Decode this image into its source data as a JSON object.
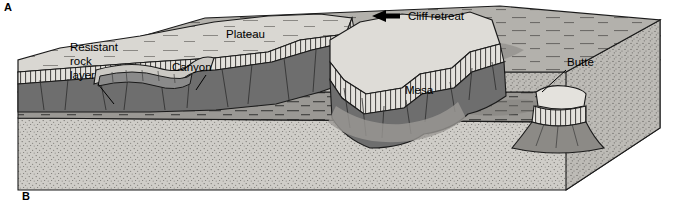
{
  "figure": {
    "background_color": "#ffffff"
  },
  "corner_labels": [
    {
      "name": "panel-label-a",
      "text": "A"
    },
    {
      "name": "panel-label-b",
      "text": "B"
    }
  ],
  "labels": {
    "resistant_rock_layer": "Resistant\nrock\nlayer",
    "resistant_line1": "Resistant",
    "resistant_line2": "rock",
    "resistant_line3": "layer",
    "canyon": "Canyon",
    "plateau": "Plateau",
    "cliff_retreat": "Cliff retreat",
    "mesa": "Mesa",
    "butte": "Butte"
  },
  "icons": {
    "cliff_retreat_arrow": "left-arrow-icon"
  },
  "colors": {
    "caprock_light": "#e8e6e1",
    "plateau_top": "#d9d7d2",
    "cliff_dark": "#6e6e6e",
    "cliff_mid": "#8a8a8a",
    "lowland_plain": "#b3b1ac",
    "shadow": "#8f8d89",
    "basal_stipple": "#cfcdc8",
    "bedded_layer": "#9a9894",
    "outline": "#1a1a1a",
    "side_face": "#bdbbb6"
  },
  "features": [
    {
      "name": "resistant-rock-layer",
      "type": "stratum",
      "description": "Light hatched caprock band forming cliff rims"
    },
    {
      "name": "canyon",
      "type": "landform",
      "description": "Narrow incised valley cut into the plateau"
    },
    {
      "name": "plateau",
      "type": "landform",
      "description": "Broad flat upland surface at left"
    },
    {
      "name": "mesa",
      "type": "landform",
      "description": "Flat-topped erosional remnant, wider than tall"
    },
    {
      "name": "butte",
      "type": "landform",
      "description": "Isolated steep-sided remnant, narrower than a mesa"
    },
    {
      "name": "cliff-retreat",
      "type": "process",
      "description": "Escarpment retreating to the left as erosion proceeds"
    }
  ],
  "strata": [
    {
      "name": "upper-stippled-layer",
      "pattern": "stipple"
    },
    {
      "name": "bedded-dashed-layer",
      "pattern": "horizontal-dashes"
    },
    {
      "name": "lower-stippled-layer",
      "pattern": "stipple"
    }
  ]
}
